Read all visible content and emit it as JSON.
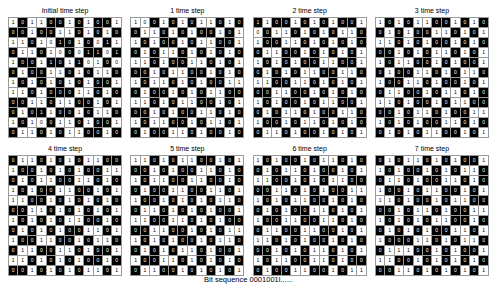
{
  "figure": {
    "caption": "Bit sequence 0001001l......",
    "rows": 12,
    "cols": 12,
    "panels": [
      {
        "title": "Initial time step",
        "cells": [
          "101100101001",
          "001001101010",
          "110101010011",
          "011010001101",
          "100110110100",
          "010011010110",
          "101010101001",
          "110100011010",
          "001101100101",
          "010110010110",
          "101001101001",
          "011010110010"
        ],
        "on": [
          "010011010110",
          "110110010101",
          "001001101010",
          "100100101101",
          "011011010010",
          "101100101001",
          "010101010110",
          "001011100101",
          "110010011010",
          "101101101001",
          "010010010110",
          "100101001101"
        ]
      },
      {
        "title": "1 time step",
        "cells": [
          "100101011010",
          "011010100101",
          "101001011001",
          "010110101010",
          "110100110101",
          "001011001010",
          "101101010011",
          "010010101100",
          "110101100101",
          "001010011010",
          "101100101101",
          "010011010010"
        ],
        "on": [
          "001010100101",
          "100101011010",
          "010110100110",
          "101001010101",
          "001011001010",
          "110100110101",
          "010010101100",
          "101101010011",
          "001010011010",
          "110101100101",
          "010011010010",
          "101100101101"
        ]
      },
      {
        "title": "2 time step",
        "cells": [
          "110010101001",
          "001101010110",
          "100110101010",
          "011001010101",
          "101010011001",
          "010101100110",
          "110011010101",
          "001100101010",
          "101001011001",
          "010110100110",
          "100101101010",
          "011010010101"
        ],
        "on": [
          "101101010110",
          "010010101001",
          "011001010101",
          "100110101010",
          "010101100110",
          "101010011001",
          "001100101010",
          "110011010101",
          "010110100110",
          "101001011001",
          "011010010101",
          "100101101010"
        ]
      },
      {
        "title": "3 time step",
        "cells": [
          "101011001010",
          "010100110101",
          "110101001010",
          "001010110101",
          "101100101001",
          "010011010110",
          "100110100101",
          "011001011010",
          "110100101100",
          "001011010011",
          "101010011010",
          "010101100101"
        ],
        "on": [
          "010100110101",
          "101011001010",
          "001010110101",
          "110101001010",
          "010011010110",
          "101100101001",
          "011001011010",
          "100110100101",
          "001011010011",
          "110100101100",
          "010101100101",
          "101010011010"
        ]
      },
      {
        "title": "4 time step",
        "cells": [
          "011010101100",
          "100101010011",
          "010110011010",
          "101001100101",
          "110010101010",
          "001101010101",
          "101010110010",
          "010101001101",
          "100110010110",
          "011001101001",
          "110101010010",
          "001010101101"
        ],
        "on": [
          "100101010011",
          "011010101100",
          "101001100101",
          "010110011010",
          "001101010101",
          "110010101010",
          "010101001101",
          "101010110010",
          "011001101001",
          "100110010110",
          "001010101101",
          "110101010010"
        ]
      },
      {
        "title": "5 time step",
        "cells": [
          "110101100101",
          "001010011010",
          "101100110010",
          "010011001101",
          "100101010110",
          "011010101001",
          "110011010100",
          "001100101011",
          "101010010110",
          "010101101001",
          "100110101010",
          "011001010101"
        ],
        "on": [
          "001010011010",
          "110101100101",
          "010011001101",
          "101100110010",
          "011010101001",
          "100101010110",
          "001100101011",
          "110011010100",
          "010101101001",
          "101010010110",
          "011001010101",
          "100110101010"
        ]
      },
      {
        "title": "6 time step",
        "cells": [
          "101001011010",
          "010110100101",
          "110010101100",
          "001101010011",
          "101011001010",
          "010100110101",
          "100110011010",
          "011001100101",
          "110101001010",
          "001010110101",
          "101100110100",
          "010011001011"
        ],
        "on": [
          "010110100101",
          "101001011010",
          "001101010011",
          "110010101100",
          "010100110101",
          "101011001010",
          "011001100101",
          "100110011010",
          "001010110101",
          "110101001010",
          "010011001011",
          "101100110100"
        ]
      },
      {
        "title": "7 time step",
        "cells": [
          "010110101001",
          "101001010110",
          "011010011010",
          "100101100101",
          "110100101100",
          "001011010011",
          "101010110010",
          "010101001101",
          "100011010110",
          "011100101001",
          "110010101010",
          "001101010101"
        ],
        "on": [
          "101001010110",
          "010110101001",
          "100101100101",
          "011010011010",
          "001011010011",
          "110100101100",
          "010101001101",
          "101010110010",
          "011100101001",
          "100011010110",
          "001101010101",
          "110010101010"
        ]
      }
    ]
  }
}
